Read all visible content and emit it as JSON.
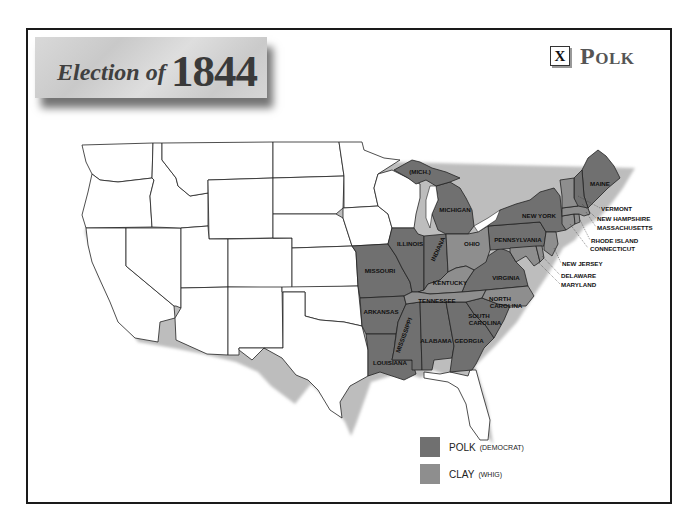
{
  "title": {
    "prefix": "Election of",
    "year": "1844"
  },
  "winner": {
    "mark": "X",
    "name": "Polk"
  },
  "colors": {
    "polk": "#707070",
    "clay": "#8e8e8e",
    "territory": "#ffffff",
    "border": "#1a1a1a"
  },
  "legend": [
    {
      "candidate": "POLK",
      "party": "(DEMOCRAT)",
      "color": "#707070"
    },
    {
      "candidate": "CLAY",
      "party": "(WHIG)",
      "color": "#8e8e8e"
    }
  ],
  "states": {
    "polk": [
      "Maine",
      "New Hampshire",
      "New York",
      "Pennsylvania",
      "Virginia",
      "South Carolina",
      "Georgia",
      "Alabama",
      "Mississippi",
      "Louisiana",
      "Arkansas",
      "Missouri",
      "Illinois",
      "Indiana",
      "Michigan"
    ],
    "clay": [
      "Vermont",
      "Massachusetts",
      "Rhode Island",
      "Connecticut",
      "New Jersey",
      "Delaware",
      "Maryland",
      "Ohio",
      "Kentucky",
      "Tennessee",
      "North Carolina"
    ]
  },
  "labels": {
    "mich_up": "(MICH.)",
    "michigan": "MICHIGAN",
    "illinois": "ILLINOIS",
    "indiana": "INDIANA",
    "ohio": "OHIO",
    "missouri": "MISSOURI",
    "kentucky": "KENTUCKY",
    "tennessee": "TENNESSEE",
    "arkansas": "ARKANSAS",
    "mississippi": "MISSISSIPPI",
    "alabama": "ALABAMA",
    "georgia": "GEORGIA",
    "louisiana": "LOUISIANA",
    "north_carolina_1": "NORTH",
    "north_carolina_2": "CAROLINA",
    "south_carolina_1": "SOUTH",
    "south_carolina_2": "CAROLINA",
    "virginia": "VIRGINIA",
    "pennsylvania": "PENNSYLVANIA",
    "new_york": "NEW YORK",
    "maine": "MAINE",
    "vermont": "VERMONT",
    "new_hampshire": "NEW HAMPSHIRE",
    "massachusetts": "MASSACHUSETTS",
    "rhode_island": "RHODE ISLAND",
    "connecticut": "CONNECTICUT",
    "new_jersey": "NEW JERSEY",
    "delaware": "DELAWARE",
    "maryland": "MARYLAND"
  }
}
